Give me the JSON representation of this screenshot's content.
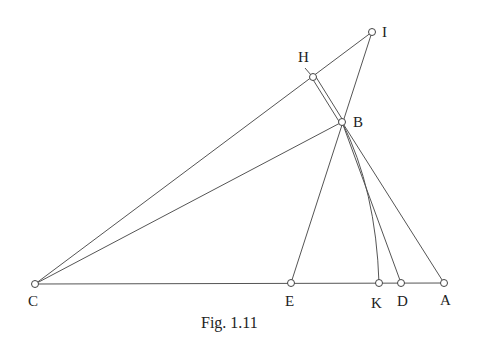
{
  "figure": {
    "caption": "Fig. 1.11",
    "points": {
      "I": {
        "label": "I",
        "x": 372,
        "y": 32
      },
      "H": {
        "label": "H",
        "x": 313,
        "y": 77
      },
      "B": {
        "label": "B",
        "x": 342,
        "y": 122
      },
      "C": {
        "label": "C",
        "x": 35,
        "y": 284
      },
      "E": {
        "label": "E",
        "x": 291,
        "y": 283
      },
      "K": {
        "label": "K",
        "x": 379,
        "y": 283
      },
      "D": {
        "label": "D",
        "x": 401,
        "y": 283
      },
      "A": {
        "label": "A",
        "x": 444,
        "y": 283
      }
    },
    "segments": [
      "C-I",
      "I-E",
      "C-B",
      "C-A",
      "B-A",
      "B-D",
      "B-K (arc)",
      "H-B (double)"
    ]
  }
}
